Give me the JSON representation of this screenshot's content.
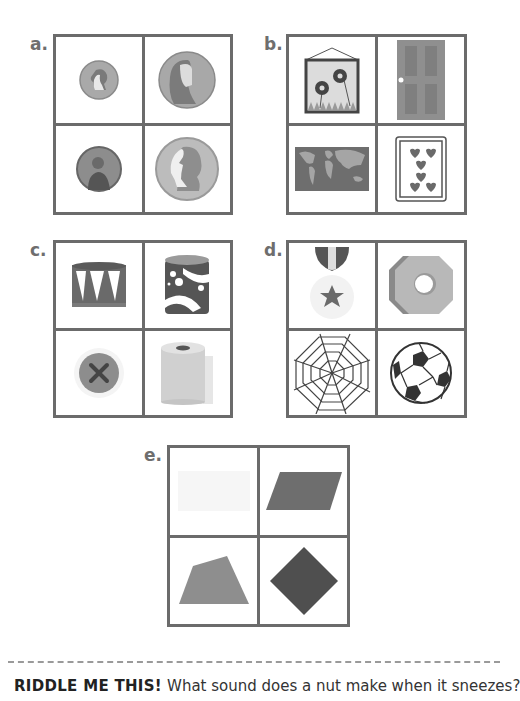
{
  "puzzles": [
    {
      "label": "a.",
      "items": [
        "small-coin-penny",
        "large-coin-half-dollar",
        "dark-coin-nickel",
        "large-coin-quarter"
      ]
    },
    {
      "label": "b.",
      "items": [
        "framed-flower-picture",
        "door",
        "world-map",
        "playing-card-seven-of-hearts"
      ]
    },
    {
      "label": "c.",
      "items": [
        "drum",
        "patterned-cylinder-can",
        "sewing-button",
        "toilet-paper-roll"
      ]
    },
    {
      "label": "d.",
      "items": [
        "star-medal",
        "hex-nut",
        "spider-web",
        "soccer-ball"
      ]
    },
    {
      "label": "e.",
      "items": [
        "faint-rectangle",
        "parallelogram",
        "trapezoid-quadrilateral",
        "diamond-square"
      ]
    }
  ],
  "riddle": {
    "heading": "RIDDLE ME THIS!",
    "question": "What sound does a nut make when it sneezes?"
  },
  "colors": {
    "grid_border": "#6b6b6b",
    "dark_gray": "#555555",
    "mid_gray": "#8a8a8a",
    "light_gray": "#bdbdbd",
    "label_gray": "#6e6e6e"
  }
}
